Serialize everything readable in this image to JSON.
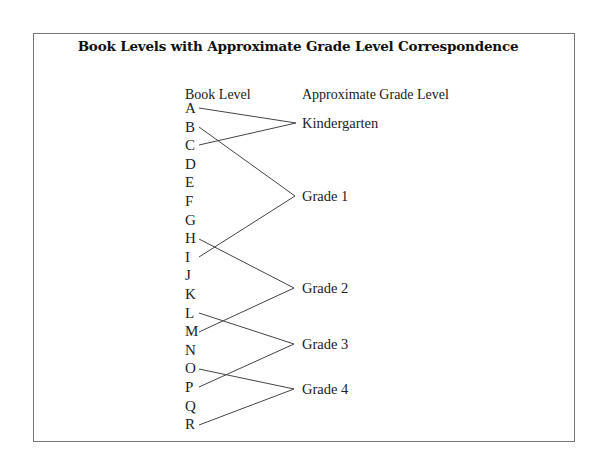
{
  "title": "Book Levels with Approximate Grade Level Correspondence",
  "headers": {
    "book_level": "Book Level",
    "grade_level": "Approximate Grade Level"
  },
  "book_levels": [
    "A",
    "B",
    "C",
    "D",
    "E",
    "F",
    "G",
    "H",
    "I",
    "J",
    "K",
    "L",
    "M",
    "N",
    "O",
    "P",
    "Q",
    "R"
  ],
  "grades": [
    {
      "label": "Kindergarten",
      "from": "A",
      "to": "C"
    },
    {
      "label": "Grade 1",
      "from": "B",
      "to": "I"
    },
    {
      "label": "Grade 2",
      "from": "H",
      "to": "M"
    },
    {
      "label": "Grade 3",
      "from": "L",
      "to": "P"
    },
    {
      "label": "Grade 4",
      "from": "O",
      "to": "R"
    }
  ]
}
